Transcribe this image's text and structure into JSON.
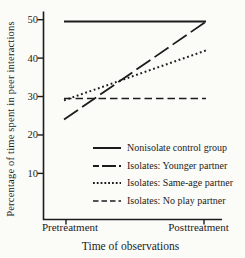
{
  "figure": {
    "background_color": "#fbfbf8",
    "line_color": "#1c1c1c"
  },
  "chart_data": {
    "type": "line",
    "title": "",
    "xlabel": "Time of observations",
    "ylabel": "Percentage of time spent in peer interactions",
    "x_categories": [
      "Pretreatment",
      "Posttreatment"
    ],
    "yticks": [
      10,
      20,
      30,
      40,
      50
    ],
    "ylim": [
      -2,
      52
    ],
    "grid": false,
    "legend_position": "inside-lower-right",
    "series": [
      {
        "name": "Nonisolate control group",
        "style": "solid",
        "dash": "",
        "legend_dash": "",
        "values": [
          49.5,
          49.5
        ]
      },
      {
        "name": "Isolates: Younger partner",
        "style": "long-dash",
        "dash": "17 5",
        "legend_dash": "6 3 14 3",
        "values": [
          24,
          49.5
        ]
      },
      {
        "name": "Isolates: Same-age partner",
        "style": "dotted",
        "dash": "1.8 2.7",
        "legend_dash": "1.8 2",
        "values": [
          29,
          42
        ]
      },
      {
        "name": "Isolates: No play partner",
        "style": "dashed",
        "dash": "7.5 4",
        "legend_dash": "5.5 3",
        "values": [
          29.5,
          29.5
        ]
      }
    ]
  }
}
